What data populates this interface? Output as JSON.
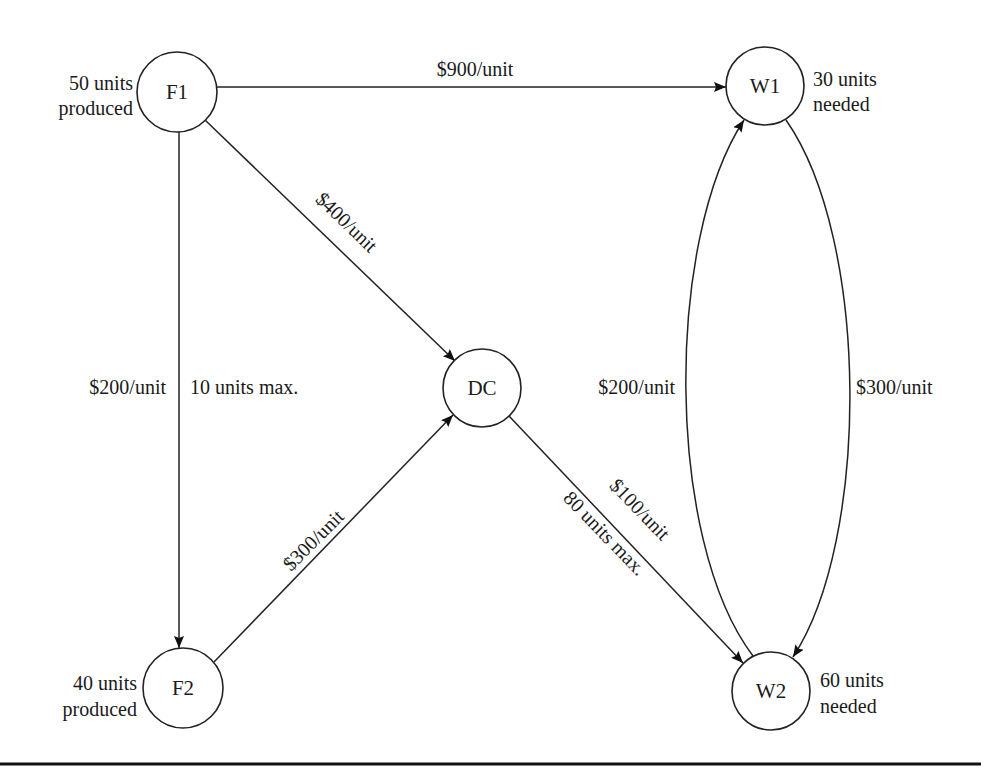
{
  "diagram": {
    "nodes": [
      {
        "id": "F1",
        "label": "F1",
        "annotation": [
          "50 units",
          "produced"
        ]
      },
      {
        "id": "F2",
        "label": "F2",
        "annotation": [
          "40 units",
          "produced"
        ]
      },
      {
        "id": "DC",
        "label": "DC",
        "annotation": []
      },
      {
        "id": "W1",
        "label": "W1",
        "annotation": [
          "30 units",
          "needed"
        ]
      },
      {
        "id": "W2",
        "label": "W2",
        "annotation": [
          "60 units",
          "needed"
        ]
      }
    ],
    "edges": [
      {
        "from": "F1",
        "to": "W1",
        "cost": "$900/unit"
      },
      {
        "from": "F1",
        "to": "DC",
        "cost": "$400/unit"
      },
      {
        "from": "F1",
        "to": "F2",
        "cost": "$200/unit",
        "capacity": "10 units max."
      },
      {
        "from": "F2",
        "to": "DC",
        "cost": "$300/unit"
      },
      {
        "from": "DC",
        "to": "W2",
        "cost": "$100/unit",
        "capacity": "80 units max."
      },
      {
        "from": "W2",
        "to": "W1",
        "cost": "$200/unit"
      },
      {
        "from": "W1",
        "to": "W2",
        "cost": "$300/unit"
      }
    ]
  }
}
